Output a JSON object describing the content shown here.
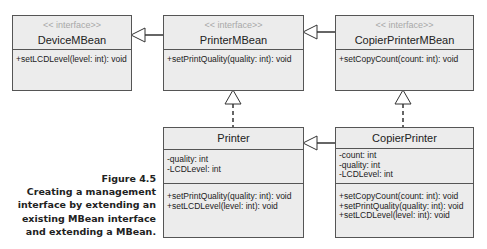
{
  "diagram": {
    "classes": {
      "device_mbean": {
        "stereotype": "<< interface>>",
        "name": "DeviceMBean",
        "attributes": [],
        "operations": [
          "+setLCDLevel(level: int): void"
        ]
      },
      "printer_mbean": {
        "stereotype": "<< interface>>",
        "name": "PrinterMBean",
        "attributes": [],
        "operations": [
          "+setPrintQuality(quality: int): void"
        ]
      },
      "copier_printer_mbean": {
        "stereotype": "<< interface>>",
        "name": "CopierPrinterMBean",
        "attributes": [],
        "operations": [
          "+setCopyCount(count: int): void"
        ]
      },
      "printer": {
        "name": "Printer",
        "attributes": [
          "-quality: int",
          "-LCDLevel: int"
        ],
        "operations": [
          "+setPrintQuality(quality: int): void",
          "+setLCDLevel(level: int): void"
        ]
      },
      "copier_printer": {
        "name": "CopierPrinter",
        "attributes": [
          "-count: int",
          "-quality: int",
          "-LCDLevel: int"
        ],
        "operations": [
          "+setCopyCount(count: int): void",
          "+setPrintQuality(quality: int): void",
          "+setLCDLevel(level: int): void"
        ]
      }
    },
    "relationships": [
      {
        "from": "PrinterMBean",
        "to": "DeviceMBean",
        "type": "generalization"
      },
      {
        "from": "CopierPrinterMBean",
        "to": "PrinterMBean",
        "type": "generalization"
      },
      {
        "from": "Printer",
        "to": "PrinterMBean",
        "type": "realization"
      },
      {
        "from": "CopierPrinter",
        "to": "CopierPrinterMBean",
        "type": "realization"
      },
      {
        "from": "CopierPrinter",
        "to": "Printer",
        "type": "generalization"
      }
    ]
  },
  "caption": {
    "figure": "Figure 4.5",
    "lines": [
      "Creating a management",
      "interface by extending an",
      "existing MBean interface",
      "and extending a MBean."
    ]
  }
}
